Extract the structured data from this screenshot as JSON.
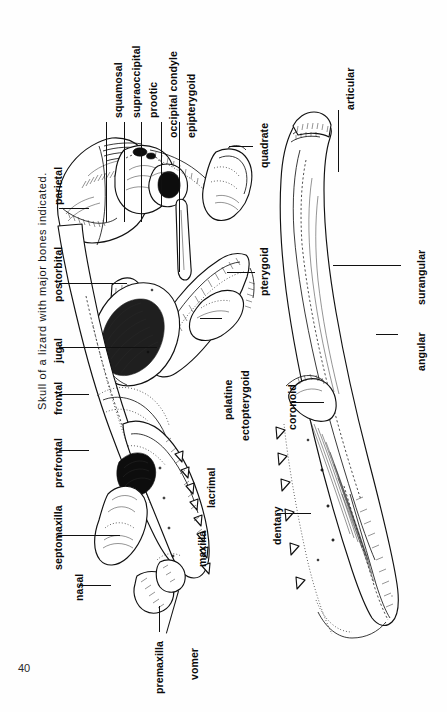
{
  "page": {
    "number": "40",
    "caption": "Skull of a lizard with major bones indicated.",
    "orientation": "rotated-90-ccw",
    "background_color": "#fefefe",
    "ink_color": "#111111"
  },
  "figure": {
    "parts": [
      {
        "id": "skull",
        "name": "skull-lateral-view"
      },
      {
        "id": "mandible",
        "name": "mandible-lateral-view"
      }
    ]
  },
  "labels": {
    "skull_dorsal_row": [
      {
        "text": "squamosal",
        "name": "label-squamosal"
      },
      {
        "text": "supraoccipital",
        "name": "label-supraoccipital"
      },
      {
        "text": "prootic",
        "name": "label-prootic"
      },
      {
        "text": "occipital condyle",
        "name": "label-occipital-condyle"
      },
      {
        "text": "epipterygoid",
        "name": "label-epipterygoid"
      },
      {
        "text": "quadrate",
        "name": "label-quadrate"
      },
      {
        "text": "pterygoid",
        "name": "label-pterygoid"
      }
    ],
    "skull_upper_row": [
      {
        "text": "parietal",
        "name": "label-parietal"
      },
      {
        "text": "postorbital",
        "name": "label-postorbital"
      },
      {
        "text": "jugal",
        "name": "label-jugal"
      },
      {
        "text": "frontal",
        "name": "label-frontal"
      },
      {
        "text": "prefrontal",
        "name": "label-prefrontal"
      },
      {
        "text": "septomaxilla",
        "name": "label-septomaxilla"
      },
      {
        "text": "nasal",
        "name": "label-nasal"
      }
    ],
    "skull_lower_row": [
      {
        "text": "palatine",
        "name": "label-palatine"
      },
      {
        "text": "ectopterygoid",
        "name": "label-ectopterygoid"
      },
      {
        "text": "lacrimal",
        "name": "label-lacrimal"
      },
      {
        "text": "maxilla",
        "name": "label-maxilla"
      },
      {
        "text": "premaxilla",
        "name": "label-premaxilla"
      },
      {
        "text": "vomer",
        "name": "label-vomer"
      }
    ],
    "mandible_row": [
      {
        "text": "articular",
        "name": "label-articular"
      },
      {
        "text": "surangular",
        "name": "label-surangular"
      },
      {
        "text": "angular",
        "name": "label-angular"
      },
      {
        "text": "coronoid",
        "name": "label-coronoid"
      },
      {
        "text": "dentary",
        "name": "label-dentary"
      }
    ]
  }
}
